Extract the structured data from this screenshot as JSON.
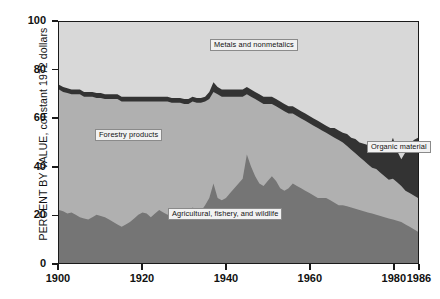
{
  "chart_data": {
    "type": "area",
    "stacked": true,
    "title": "",
    "subtitle": "",
    "xlabel": "",
    "ylabel": "PERCENT BY VALUE, constant 1972 dollars",
    "xlim": [
      1900,
      1986
    ],
    "ylim": [
      0,
      100
    ],
    "grid": false,
    "legend_position": "inline-annotations",
    "x_ticks": [
      "1900",
      "1920",
      "1940",
      "1960",
      "1980",
      "1986"
    ],
    "x_tick_values": [
      1900,
      1920,
      1940,
      1960,
      1980,
      1986
    ],
    "y_ticks": [
      "0",
      "20",
      "40",
      "60",
      "80",
      "100"
    ],
    "y_tick_values": [
      0,
      20,
      40,
      60,
      80,
      100
    ],
    "annotations": [
      {
        "text": "Metals and nonmetalics",
        "series": "Metals and nonmetalics"
      },
      {
        "text": "Forestry products",
        "series": "Forestry products"
      },
      {
        "text": "Agricultural, fishery, and wildlife",
        "series": "Agricultural, fishery, and wildlife"
      },
      {
        "text": "Organic material",
        "series": "Organic material"
      }
    ],
    "colors": {
      "agricultural": "#757575",
      "forestry": "#b0b0b0",
      "organic": "#333333",
      "metals": "#d8d8d8",
      "frame": "#1a1a1a",
      "background": "#ffffff"
    },
    "x": [
      1900,
      1901,
      1902,
      1903,
      1904,
      1905,
      1906,
      1907,
      1908,
      1909,
      1910,
      1911,
      1912,
      1913,
      1914,
      1915,
      1916,
      1917,
      1918,
      1919,
      1920,
      1921,
      1922,
      1923,
      1924,
      1925,
      1926,
      1927,
      1928,
      1929,
      1930,
      1931,
      1932,
      1933,
      1934,
      1935,
      1936,
      1937,
      1938,
      1939,
      1940,
      1941,
      1942,
      1943,
      1944,
      1945,
      1946,
      1947,
      1948,
      1949,
      1950,
      1951,
      1952,
      1953,
      1954,
      1955,
      1956,
      1957,
      1958,
      1959,
      1960,
      1961,
      1962,
      1963,
      1964,
      1965,
      1966,
      1967,
      1968,
      1969,
      1970,
      1971,
      1972,
      1973,
      1974,
      1975,
      1976,
      1977,
      1978,
      1979,
      1980,
      1981,
      1982,
      1983,
      1984,
      1985,
      1986
    ],
    "series": [
      {
        "name": "Agricultural, fishery, and wildlife",
        "order": 1,
        "color": "#757575",
        "values": [
          22,
          21.5,
          20.5,
          21,
          20,
          19,
          18.5,
          18,
          19,
          20,
          19.5,
          19,
          18,
          17,
          16,
          15,
          16,
          17,
          18.5,
          20,
          21,
          20.5,
          19,
          20.5,
          22,
          21,
          20,
          21,
          20.5,
          19,
          20,
          21.5,
          23,
          22,
          21.5,
          24,
          27,
          33,
          27,
          26,
          27,
          29,
          31,
          33,
          35,
          45,
          40,
          36,
          33,
          32,
          34,
          36,
          34,
          31,
          30,
          31,
          33,
          32,
          31,
          30,
          29,
          28,
          27,
          27,
          27,
          26,
          25,
          24,
          24,
          23.5,
          23,
          22.5,
          22,
          21.5,
          21,
          20.5,
          20,
          19.5,
          19,
          18.5,
          18,
          17.5,
          17,
          16,
          15,
          14,
          13
        ]
      },
      {
        "name": "Forestry products",
        "order": 2,
        "color": "#b0b0b0",
        "values": [
          50,
          49.5,
          50,
          49,
          50,
          51,
          50.5,
          51,
          50,
          48.5,
          49,
          49,
          50,
          51,
          52,
          52,
          51,
          50,
          48.5,
          47,
          46,
          46.5,
          48,
          46.5,
          45,
          46,
          47,
          45.5,
          46,
          47.5,
          46,
          44.5,
          44,
          44.5,
          45,
          43,
          41,
          38,
          43,
          43,
          42,
          40,
          38,
          36,
          34,
          25,
          29,
          32,
          34,
          34,
          32,
          30,
          31,
          33,
          33,
          31,
          29,
          29,
          29,
          29,
          29,
          29,
          29,
          28,
          27,
          27,
          27,
          27,
          26,
          25,
          24,
          23,
          22,
          21,
          20,
          19,
          19,
          18,
          17,
          16,
          17,
          16,
          15,
          14,
          14,
          14,
          14
        ]
      },
      {
        "name": "Organic material",
        "order": 3,
        "color": "#333333",
        "values": [
          2,
          2,
          2,
          2,
          2,
          2,
          2,
          2,
          2,
          2,
          2,
          2,
          2,
          2,
          2,
          2,
          2,
          2,
          2,
          2,
          2,
          2,
          2,
          2,
          2,
          2,
          2,
          2,
          2,
          2,
          2,
          2,
          2,
          2,
          2,
          2,
          3,
          4,
          3,
          3,
          3,
          3,
          3,
          3,
          3,
          3,
          3,
          3,
          3,
          3,
          3,
          3,
          3,
          3,
          3,
          3,
          3,
          3,
          3,
          3,
          3,
          3,
          3,
          3,
          3,
          3,
          4,
          4,
          4,
          5,
          5,
          6,
          6,
          7,
          8,
          9,
          10,
          11,
          12,
          13,
          17,
          13,
          11,
          16,
          20,
          23,
          25
        ]
      },
      {
        "name": "Metals and nonmetalics",
        "order": 4,
        "color": "#d8d8d8",
        "values": [
          26,
          27,
          27.5,
          28,
          28,
          28,
          29,
          29,
          29,
          29.5,
          29.5,
          30,
          30,
          30,
          30,
          31,
          31,
          31,
          31,
          31,
          31,
          31,
          31,
          31,
          31,
          31,
          31,
          32.5,
          31.5,
          31.5,
          32,
          32,
          31,
          31.5,
          31.5,
          31,
          29,
          25,
          27,
          28,
          28,
          28,
          28,
          28,
          28,
          27,
          28,
          29,
          30,
          31,
          31,
          31,
          32,
          33,
          34,
          35,
          35,
          36,
          37,
          38,
          39,
          40,
          41,
          42,
          43,
          44,
          44,
          45,
          46,
          47.5,
          49,
          50,
          51,
          52,
          53,
          55,
          56,
          57,
          58,
          57,
          50,
          56,
          62,
          54,
          48,
          47,
          48
        ]
      }
    ]
  },
  "yaxis": {
    "title": "PERCENT BY VALUE, constant 1972 dollars",
    "ticks": [
      {
        "label": "100",
        "value": 100
      },
      {
        "label": "80",
        "value": 80
      },
      {
        "label": "60",
        "value": 60
      },
      {
        "label": "40",
        "value": 40
      },
      {
        "label": "20",
        "value": 20
      },
      {
        "label": "0",
        "value": 0
      }
    ]
  },
  "xaxis": {
    "ticks": [
      {
        "label": "1900",
        "value": 1900
      },
      {
        "label": "1920",
        "value": 1920
      },
      {
        "label": "1940",
        "value": 1940
      },
      {
        "label": "1960",
        "value": 1960
      },
      {
        "label": "1980",
        "value": 1980
      },
      {
        "label": "1986",
        "value": 1986
      }
    ]
  },
  "labels": {
    "metals": "Metals and nonmetalics",
    "forestry": "Forestry products",
    "agricultural": "Agricultural, fishery, and wildlife",
    "organic": "Organic material"
  }
}
